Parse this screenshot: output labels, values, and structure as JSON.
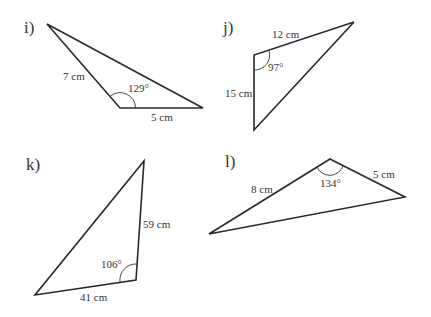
{
  "triangles": [
    {
      "id": "i",
      "label": "i)",
      "vertices": [
        [
          47,
          24
        ],
        [
          120,
          108
        ],
        [
          203,
          108
        ]
      ],
      "sides": [
        {
          "text": "7 cm"
        },
        {
          "text": "5 cm"
        }
      ],
      "angle": {
        "text": "129°"
      }
    },
    {
      "id": "j",
      "label": "j)",
      "vertices": [
        [
          354,
          22
        ],
        [
          254,
          55
        ],
        [
          254,
          130
        ]
      ],
      "sides": [
        {
          "text": "12 cm"
        },
        {
          "text": "15 cm"
        }
      ],
      "angle": {
        "text": "97°"
      }
    },
    {
      "id": "k",
      "label": "k)",
      "vertices": [
        [
          144,
          161
        ],
        [
          136,
          280
        ],
        [
          35,
          295
        ]
      ],
      "sides": [
        {
          "text": "59 cm"
        },
        {
          "text": "41 cm"
        }
      ],
      "angle": {
        "text": "106°"
      }
    },
    {
      "id": "l",
      "label": "l)",
      "vertices": [
        [
          330,
          159
        ],
        [
          405,
          197
        ],
        [
          209,
          234
        ]
      ],
      "sides": [
        {
          "text": "8 cm"
        },
        {
          "text": "5 cm"
        }
      ],
      "angle": {
        "text": "134°"
      }
    }
  ]
}
